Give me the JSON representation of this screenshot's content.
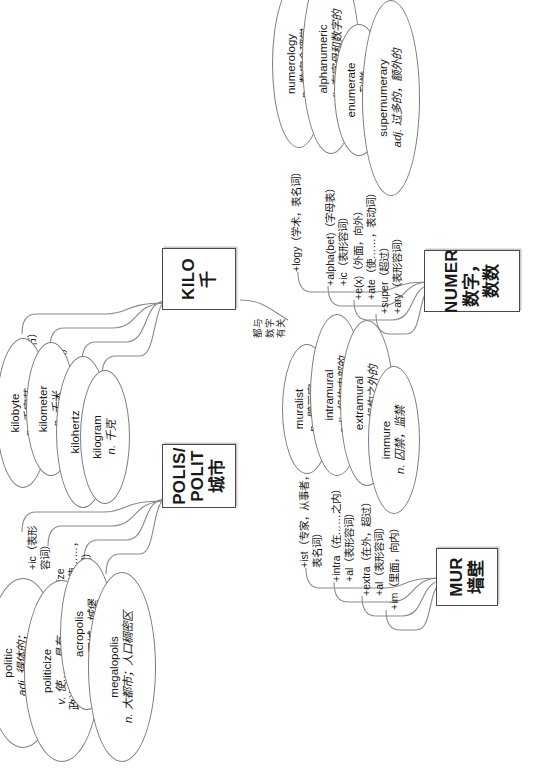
{
  "poster": {
    "title": "英语词根思维导图",
    "rotation_note": "content rendered rotated 90 degrees"
  },
  "clusters": [
    {
      "id": "polis",
      "root_en": "POLIS/\nPOLIT",
      "root_en_line1": "POLIS/",
      "root_en_line2": "POLIT",
      "root_cn": "城市",
      "branches": [
        {
          "affix": "+ic（表形\n容词）",
          "word": "politic",
          "pos": "adj.",
          "def_line1": "adj. 得体的；",
          "def_line2": "善于推进计划的"
        },
        {
          "affix": "+ize（使……，\n表动词）",
          "word": "politicize",
          "pos": "v.",
          "def_line1": "v. 使……具有",
          "def_line2": "政治特色或气氛"
        },
        {
          "affix": "+acro（高）",
          "word": "acropolis",
          "pos": "n.",
          "def_line1": "n. 卫城，城堡",
          "def_line2": ""
        },
        {
          "affix": "+mega（大）",
          "word": "megalopolis",
          "pos": "n.",
          "def_line1": "n. 大都市；人口稠密区",
          "def_line2": ""
        }
      ]
    },
    {
      "id": "kilo",
      "root_en": "KILO",
      "root_en_line1": "KILO",
      "root_en_line2": "",
      "root_cn": "千",
      "branches": [
        {
          "affix": "+byte（字节）",
          "word": "kilobyte",
          "pos": "n.",
          "def_line1": "n. 千字节",
          "def_line2": ""
        },
        {
          "affix": "+meter（米）",
          "word": "kilometer",
          "pos": "n.",
          "def_line1": "n. 千米",
          "def_line2": ""
        },
        {
          "affix": "+hertz（赫兹）",
          "word": "kilohertz",
          "pos": "n.",
          "def_line1": "n. 千赫（兹）",
          "def_line2": ""
        },
        {
          "affix": "+gram（克）",
          "word": "kilogram",
          "pos": "n.",
          "def_line1": "n. 千克",
          "def_line2": ""
        }
      ]
    },
    {
      "id": "mur",
      "root_en": "MUR",
      "root_en_line1": "MUR",
      "root_en_line2": "",
      "root_cn": "墙壁",
      "branches": [
        {
          "affix": "+ist（专家，从事者，\n表名词）",
          "word": "muralist",
          "pos": "n.",
          "def_line1": "n. 壁画家",
          "def_line2": ""
        },
        {
          "affix": "+intra（在……之内）\n+al（表形容词）",
          "word": "intramural",
          "pos": "adj.",
          "def_line1": "adj. 机构内部的",
          "def_line2": ""
        },
        {
          "affix": "+extra（在外，超过）\n+al（表形容词）",
          "word": "extramural",
          "pos": "adj.",
          "def_line1": "adj. 机构之外的",
          "def_line2": ""
        },
        {
          "affix": "+im（里面，向内）",
          "word": "immure",
          "pos": "n.",
          "def_line1": "n. 囚禁，监禁",
          "def_line2": ""
        }
      ]
    },
    {
      "id": "numer",
      "root_en": "NUMER",
      "root_en_line1": "NUMER",
      "root_en_line2": "",
      "root_cn": "数字，数数",
      "branches": [
        {
          "affix": "+logy（学术，表名词）",
          "word": "numerology",
          "pos": "n.",
          "def_line1": "n. 数字命理学",
          "def_line2": ""
        },
        {
          "affix": "+alpha(bet)（字母表）\n+ic（表形容词）",
          "word": "alphanumeric",
          "pos": "adj.",
          "def_line1": "adj. 有字母和数字的",
          "def_line2": ""
        },
        {
          "affix": "+e(x)（外面，向外）\n+ate（使……，表动词）",
          "word": "enumerate",
          "pos": "v.",
          "def_line1": "v. 列举",
          "def_line2": ""
        },
        {
          "affix": "+super（超过）\n+ary（表形容词）",
          "word": "supernumerary",
          "pos": "adj.",
          "def_line1": "adj. 过多的，额外的",
          "def_line2": ""
        }
      ]
    }
  ],
  "link_note": "都与\n数字\n有关",
  "colors": {
    "ink": "#1a1a1a",
    "wire": "#8a8a8a",
    "box_border": "#4a4a4a",
    "bubble_border": "#7d7d7d",
    "background": "#ffffff"
  }
}
